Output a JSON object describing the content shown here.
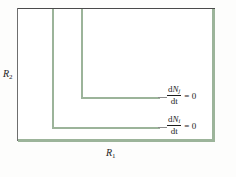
{
  "figure": {
    "background_color": "#fdfdfc",
    "plot_background_color": "#ffffff",
    "nullcline_color": "#9cb49a",
    "frame_dark_color": "#4a4a4a",
    "text_color": "#1c1c1c"
  },
  "axes": {
    "x_label_base": "R",
    "x_label_sub": "1",
    "y_label_base": "R",
    "y_label_sub": "2"
  },
  "nullclines": [
    {
      "id": "j",
      "equation_numerator_d": "d",
      "equation_numerator_var": "N",
      "equation_numerator_sub": "j",
      "equation_denominator": "dt",
      "equation_rhs": "= 0"
    },
    {
      "id": "i",
      "equation_numerator_d": "d",
      "equation_numerator_var": "N",
      "equation_numerator_sub": "i",
      "equation_denominator": "dt",
      "equation_rhs": "= 0"
    }
  ]
}
